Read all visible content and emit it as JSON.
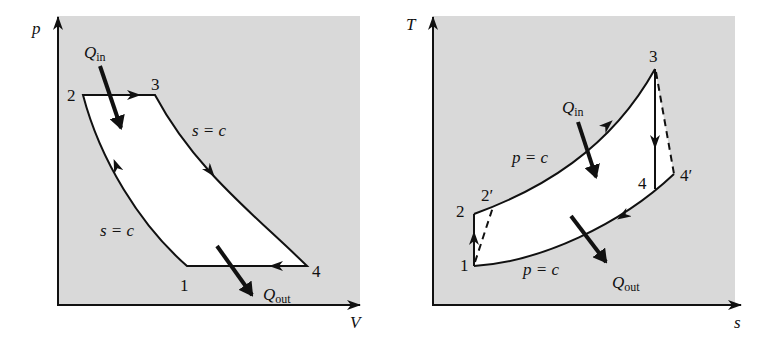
{
  "figure": {
    "left_panel": {
      "title": "p-V diagram",
      "y_axis_label": "p",
      "x_axis_label": "V",
      "points": [
        {
          "id": "1",
          "label": "1"
        },
        {
          "id": "2",
          "label": "2"
        },
        {
          "id": "3",
          "label": "3"
        },
        {
          "id": "4",
          "label": "4"
        }
      ],
      "process_labels": {
        "isentropic_expansion": "s = c",
        "isentropic_compression": "s = c"
      },
      "heat_in": {
        "main": "Q",
        "sub": "in"
      },
      "heat_out": {
        "main": "Q",
        "sub": "out"
      }
    },
    "right_panel": {
      "title": "T-s diagram",
      "y_axis_label": "T",
      "x_axis_label": "s",
      "points": [
        {
          "id": "1",
          "label": "1"
        },
        {
          "id": "2",
          "label": "2"
        },
        {
          "id": "2p",
          "label": "2′"
        },
        {
          "id": "3",
          "label": "3"
        },
        {
          "id": "4",
          "label": "4"
        },
        {
          "id": "4p",
          "label": "4′"
        }
      ],
      "process_labels": {
        "heat_addition": "p = c",
        "heat_rejection": "p = c"
      },
      "heat_in": {
        "main": "Q",
        "sub": "in"
      },
      "heat_out": {
        "main": "Q",
        "sub": "out"
      }
    },
    "colors": {
      "background_fill": "#d9d9d9",
      "cycle_fill": "#ffffff",
      "line": "#111111"
    }
  }
}
